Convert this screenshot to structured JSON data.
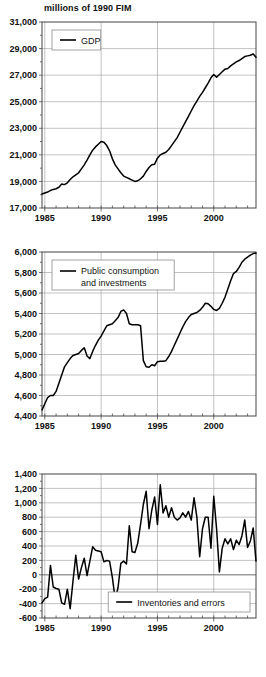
{
  "figure": {
    "units_title": "millions of 1990 FIM",
    "panel_count": 3
  },
  "chart_data": [
    {
      "type": "line",
      "title": "millions of 1990 FIM",
      "xlabel": "",
      "ylabel": "",
      "grid": true,
      "legend_position": "top-left",
      "legend": [
        "GDP"
      ],
      "xlim": [
        1984.75,
        2003.75
      ],
      "ylim": [
        17000,
        31000
      ],
      "xticks": [
        1985,
        1990,
        1995,
        2000
      ],
      "xticklabels": [
        "1985",
        "1990",
        "1995",
        "2000"
      ],
      "yticks": [
        17000,
        19000,
        21000,
        23000,
        25000,
        27000,
        29000,
        31000
      ],
      "yticklabels": [
        "17,000",
        "19,000",
        "21,000",
        "23,000",
        "25,000",
        "27,000",
        "29,000",
        "31,000"
      ],
      "series": [
        {
          "name": "GDP",
          "x": [
            1984.75,
            1985.0,
            1985.25,
            1985.5,
            1985.75,
            1986.0,
            1986.25,
            1986.5,
            1986.75,
            1987.0,
            1987.25,
            1987.5,
            1987.75,
            1988.0,
            1988.25,
            1988.5,
            1988.75,
            1989.0,
            1989.25,
            1989.5,
            1989.75,
            1990.0,
            1990.25,
            1990.5,
            1990.75,
            1991.0,
            1991.25,
            1991.5,
            1991.75,
            1992.0,
            1992.25,
            1992.5,
            1992.75,
            1993.0,
            1993.25,
            1993.5,
            1993.75,
            1994.0,
            1994.25,
            1994.5,
            1994.75,
            1995.0,
            1995.25,
            1995.5,
            1995.75,
            1996.0,
            1996.25,
            1996.5,
            1996.75,
            1997.0,
            1997.25,
            1997.5,
            1997.75,
            1998.0,
            1998.25,
            1998.5,
            1998.75,
            1999.0,
            1999.25,
            1999.5,
            1999.75,
            2000.0,
            2000.25,
            2000.5,
            2000.75,
            2001.0,
            2001.25,
            2001.5,
            2001.75,
            2002.0,
            2002.25,
            2002.5,
            2002.75,
            2003.0,
            2003.25,
            2003.5,
            2003.75
          ],
          "values": [
            18050,
            18130,
            18200,
            18320,
            18400,
            18450,
            18560,
            18800,
            18760,
            18900,
            19150,
            19350,
            19500,
            19650,
            19950,
            20250,
            20600,
            21000,
            21350,
            21600,
            21800,
            22000,
            21950,
            21700,
            21300,
            20700,
            20250,
            19950,
            19650,
            19400,
            19300,
            19200,
            19100,
            19000,
            19050,
            19200,
            19400,
            19750,
            20050,
            20250,
            20300,
            20750,
            21000,
            21100,
            21200,
            21400,
            21700,
            22000,
            22300,
            22700,
            23100,
            23500,
            23900,
            24300,
            24700,
            25050,
            25400,
            25700,
            26050,
            26400,
            26800,
            27050,
            26850,
            27050,
            27250,
            27450,
            27500,
            27700,
            27850,
            28000,
            28100,
            28250,
            28400,
            28450,
            28500,
            28600,
            28350
          ]
        }
      ]
    },
    {
      "type": "line",
      "title": "",
      "xlabel": "",
      "ylabel": "",
      "grid": true,
      "legend_position": "top-left",
      "legend": [
        "Public consumption and investments"
      ],
      "xlim": [
        1984.75,
        2003.75
      ],
      "ylim": [
        4400,
        6000
      ],
      "xticks": [
        1985,
        1990,
        1995,
        2000
      ],
      "xticklabels": [
        "1985",
        "1990",
        "1995",
        "2000"
      ],
      "yticks": [
        4400,
        4600,
        4800,
        5000,
        5200,
        5400,
        5600,
        5800,
        6000
      ],
      "yticklabels": [
        "4,400",
        "4,600",
        "4,800",
        "5,000",
        "5,200",
        "5,400",
        "5,600",
        "5,800",
        "6,000"
      ],
      "series": [
        {
          "name": "Public consumption and investments",
          "x": [
            1984.75,
            1985.0,
            1985.25,
            1985.5,
            1985.75,
            1986.0,
            1986.25,
            1986.5,
            1986.75,
            1987.0,
            1987.25,
            1987.5,
            1987.75,
            1988.0,
            1988.25,
            1988.5,
            1988.75,
            1989.0,
            1989.25,
            1989.5,
            1989.75,
            1990.0,
            1990.25,
            1990.5,
            1990.75,
            1991.0,
            1991.25,
            1991.5,
            1991.75,
            1992.0,
            1992.25,
            1992.5,
            1992.75,
            1993.0,
            1993.25,
            1993.5,
            1993.75,
            1994.0,
            1994.25,
            1994.5,
            1994.75,
            1995.0,
            1995.25,
            1995.5,
            1995.75,
            1996.0,
            1996.25,
            1996.5,
            1996.75,
            1997.0,
            1997.25,
            1997.5,
            1997.75,
            1998.0,
            1998.25,
            1998.5,
            1998.75,
            1999.0,
            1999.25,
            1999.5,
            1999.75,
            2000.0,
            2000.25,
            2000.5,
            2000.75,
            2001.0,
            2001.25,
            2001.5,
            2001.75,
            2002.0,
            2002.25,
            2002.5,
            2002.75,
            2003.0,
            2003.25,
            2003.5,
            2003.75
          ],
          "values": [
            4460,
            4520,
            4580,
            4600,
            4600,
            4640,
            4720,
            4800,
            4880,
            4920,
            4960,
            4990,
            5000,
            5010,
            5040,
            5065,
            4985,
            4960,
            5030,
            5090,
            5140,
            5180,
            5230,
            5280,
            5290,
            5300,
            5330,
            5360,
            5420,
            5435,
            5400,
            5300,
            5290,
            5290,
            5290,
            5280,
            4940,
            4880,
            4875,
            4900,
            4890,
            4930,
            4935,
            4935,
            4940,
            4980,
            5030,
            5090,
            5150,
            5210,
            5270,
            5320,
            5360,
            5390,
            5400,
            5410,
            5430,
            5460,
            5500,
            5495,
            5470,
            5440,
            5430,
            5450,
            5500,
            5560,
            5640,
            5720,
            5790,
            5810,
            5850,
            5900,
            5930,
            5950,
            5970,
            5985,
            5990
          ]
        }
      ]
    },
    {
      "type": "line",
      "title": "",
      "xlabel": "",
      "ylabel": "",
      "grid": true,
      "legend_position": "bottom-right",
      "legend": [
        "Inventories and errors"
      ],
      "xlim": [
        1984.75,
        2003.75
      ],
      "ylim": [
        -600,
        1400
      ],
      "xticks": [
        1985,
        1990,
        1995,
        2000
      ],
      "xticklabels": [
        "1985",
        "1990",
        "1995",
        "2000"
      ],
      "yticks": [
        -600,
        -400,
        -200,
        0,
        200,
        400,
        600,
        800,
        1000,
        1200,
        1400
      ],
      "yticklabels": [
        "-600",
        "-400",
        "-200",
        "0",
        "200",
        "400",
        "600",
        "800",
        "1,000",
        "1,200",
        "1,400"
      ],
      "series": [
        {
          "name": "Inventories and errors",
          "x": [
            1984.75,
            1985.0,
            1985.25,
            1985.5,
            1985.75,
            1986.0,
            1986.25,
            1986.5,
            1986.75,
            1987.0,
            1987.25,
            1987.5,
            1987.75,
            1988.0,
            1988.25,
            1988.5,
            1988.75,
            1989.0,
            1989.25,
            1989.5,
            1989.75,
            1990.0,
            1990.25,
            1990.5,
            1990.75,
            1991.0,
            1991.25,
            1991.5,
            1991.75,
            1992.0,
            1992.25,
            1992.5,
            1992.75,
            1993.0,
            1993.25,
            1993.5,
            1993.75,
            1994.0,
            1994.25,
            1994.5,
            1994.75,
            1995.0,
            1995.25,
            1995.5,
            1995.75,
            1996.0,
            1996.25,
            1996.5,
            1996.75,
            1997.0,
            1997.25,
            1997.5,
            1997.75,
            1998.0,
            1998.25,
            1998.5,
            1998.75,
            1999.0,
            1999.25,
            1999.5,
            1999.75,
            2000.0,
            2000.25,
            2000.5,
            2000.75,
            2001.0,
            2001.25,
            2001.5,
            2001.75,
            2002.0,
            2002.25,
            2002.5,
            2002.75,
            2003.0,
            2003.25,
            2003.5,
            2003.75
          ],
          "values": [
            -390,
            -330,
            -310,
            130,
            -170,
            -190,
            -200,
            -390,
            -410,
            -200,
            -470,
            -90,
            270,
            -60,
            100,
            230,
            -10,
            190,
            390,
            340,
            330,
            320,
            180,
            200,
            190,
            -40,
            -340,
            -180,
            160,
            190,
            150,
            680,
            320,
            310,
            440,
            700,
            980,
            1160,
            640,
            900,
            1080,
            700,
            1250,
            860,
            960,
            800,
            930,
            800,
            760,
            790,
            860,
            800,
            880,
            760,
            1070,
            800,
            250,
            640,
            800,
            800,
            370,
            1090,
            640,
            40,
            370,
            500,
            430,
            500,
            350,
            480,
            420,
            540,
            760,
            380,
            470,
            650,
            190
          ]
        }
      ]
    }
  ]
}
